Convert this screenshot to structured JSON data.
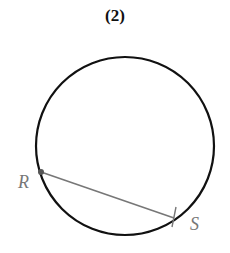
{
  "figure": {
    "title": "(2)",
    "circle": {
      "cx": 125,
      "cy": 146,
      "r": 89,
      "stroke": "#111111"
    },
    "chord": {
      "from": "R",
      "to": "S",
      "color": "#777777"
    },
    "points": [
      {
        "label": "R",
        "x": 41,
        "y": 172
      },
      {
        "label": "S",
        "x": 174,
        "y": 218
      }
    ]
  }
}
